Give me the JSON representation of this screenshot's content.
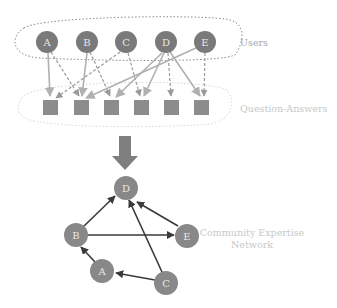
{
  "diagram": {
    "users_label": "Users",
    "qa_label": "Question-Answers",
    "network_label_line1": "Community Expertise",
    "network_label_line2": "Network",
    "colors": {
      "user_node": "#7a7a7a",
      "qa_box": "#8c8c8c",
      "solid_edge": "#b0b0b0",
      "dashed_edge": "#9a9a9a",
      "network_node": "#888888",
      "network_edge": "#3a3a3a",
      "big_arrow": "#7f7f7f"
    },
    "users": [
      {
        "id": "A",
        "label": "A"
      },
      {
        "id": "B",
        "label": "B"
      },
      {
        "id": "C",
        "label": "C"
      },
      {
        "id": "D",
        "label": "D"
      },
      {
        "id": "E",
        "label": "E"
      }
    ],
    "question_answers": [
      {
        "id": "q1"
      },
      {
        "id": "q2"
      },
      {
        "id": "q3"
      },
      {
        "id": "q4"
      },
      {
        "id": "q5"
      },
      {
        "id": "q6"
      }
    ],
    "user_qa_edges": [
      {
        "from": "A",
        "to": "q1",
        "style": "solid"
      },
      {
        "from": "A",
        "to": "q2",
        "style": "dashed"
      },
      {
        "from": "B",
        "to": "q2",
        "style": "solid"
      },
      {
        "from": "B",
        "to": "q3",
        "style": "dashed"
      },
      {
        "from": "C",
        "to": "q1",
        "style": "dashed"
      },
      {
        "from": "C",
        "to": "q4",
        "style": "dashed"
      },
      {
        "from": "D",
        "to": "q3",
        "style": "solid"
      },
      {
        "from": "D",
        "to": "q4",
        "style": "solid"
      },
      {
        "from": "D",
        "to": "q5",
        "style": "dashed"
      },
      {
        "from": "D",
        "to": "q6",
        "style": "solid"
      },
      {
        "from": "E",
        "to": "q2",
        "style": "solid"
      },
      {
        "from": "E",
        "to": "q6",
        "style": "dashed"
      }
    ],
    "network_nodes": [
      {
        "id": "D",
        "label": "D"
      },
      {
        "id": "B",
        "label": "B"
      },
      {
        "id": "E",
        "label": "E"
      },
      {
        "id": "A",
        "label": "A"
      },
      {
        "id": "C",
        "label": "C"
      }
    ],
    "network_edges": [
      {
        "from": "B",
        "to": "D"
      },
      {
        "from": "B",
        "to": "E"
      },
      {
        "from": "E",
        "to": "D"
      },
      {
        "from": "C",
        "to": "D"
      },
      {
        "from": "A",
        "to": "B"
      },
      {
        "from": "C",
        "to": "A"
      }
    ]
  }
}
